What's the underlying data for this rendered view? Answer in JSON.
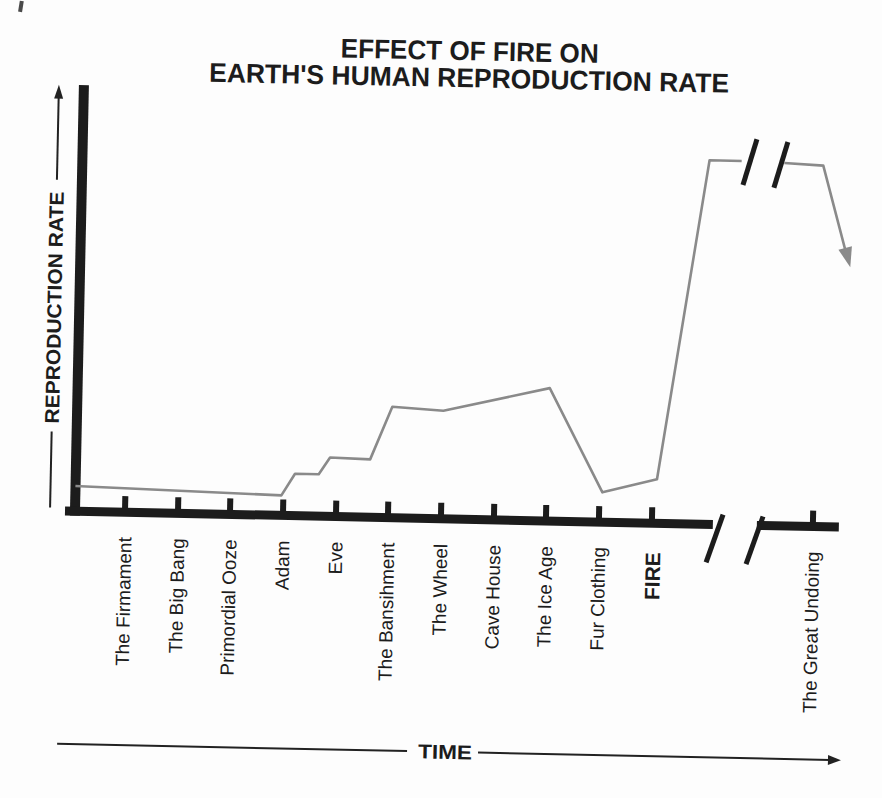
{
  "page": {
    "background_color": "#fdfdfd"
  },
  "chart_data": {
    "type": "line",
    "title": "EFFECT OF FIRE ON EARTH'S HUMAN REPRODUCTION RATE",
    "title_lines": [
      "EFFECT OF FIRE ON",
      "EARTH'S HUMAN REPRODUCTION RATE"
    ],
    "xlabel": "TIME",
    "ylabel": "REPRODUCTION RATE",
    "categories": [
      "The Firmament",
      "The Big Bang",
      "Primordial Ooze",
      "Adam",
      "Eve",
      "The Bansihment",
      "The Wheel",
      "Cave House",
      "The Ice Age",
      "Fur Clothing",
      "FIRE",
      "The Great Undoing"
    ],
    "emphasized_category": "FIRE",
    "axis_break": {
      "x_axis": true,
      "between": [
        "FIRE",
        "The Great Undoing"
      ]
    },
    "line_break_over_axis_break": true,
    "y_axis": {
      "arrow": "up",
      "numeric_ticks": false
    },
    "x_axis": {
      "arrow": "right",
      "numeric_ticks": false
    },
    "end_arrow_direction": "down-right",
    "series": [
      {
        "name": "Reproduction rate",
        "color": "#8a8a8a",
        "x_unit": "category-index (0 = The Firmament, 10 = FIRE)",
        "y_unit": "relative rate 0-100",
        "segments": [
          [
            [
              -0.95,
              6.9
            ],
            [
              2.96,
              5.5
            ],
            [
              3.21,
              11.5
            ],
            [
              3.66,
              11.5
            ],
            [
              3.87,
              16.2
            ],
            [
              4.63,
              15.9
            ],
            [
              5.03,
              30.5
            ],
            [
              6.0,
              29.7
            ],
            [
              8.01,
              36.5
            ],
            [
              9.05,
              8.2
            ],
            [
              10.08,
              12.1
            ],
            [
              10.95,
              100
            ],
            [
              11.56,
              100
            ]
          ],
          [
            [
              12.37,
              99.7
            ],
            [
              13.11,
              99.2
            ],
            [
              13.62,
              73.1
            ]
          ]
        ]
      }
    ],
    "colors": {
      "axis": "#1c1c1c",
      "text": "#1c1c1c",
      "line": "#8a8a8a"
    },
    "legend": false,
    "grid": false
  }
}
